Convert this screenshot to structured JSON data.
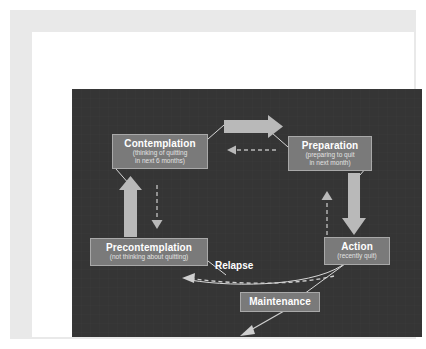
{
  "figure": {
    "panel_background": "#353535",
    "box_fill": "#7a7a7a",
    "box_border": "#a9a9a9",
    "arrow_fill": "#b9b9b9",
    "line_color": "#d8d8d8",
    "mat_color": "#e9e9e9",
    "page_color": "#ffffff"
  },
  "diagram": {
    "type": "cycle",
    "stages": [
      {
        "id": "precontemplation",
        "title": "Precontemplation",
        "subtitle_line1": "(not thinking about quitting)",
        "subtitle_line2": ""
      },
      {
        "id": "contemplation",
        "title": "Contemplation",
        "subtitle_line1": "(thinking of quitting",
        "subtitle_line2": "in next 6 months)"
      },
      {
        "id": "preparation",
        "title": "Preparation",
        "subtitle_line1": "(preparing to quit",
        "subtitle_line2": "in next month)"
      },
      {
        "id": "action",
        "title": "Action",
        "subtitle_line1": "(recently quit)",
        "subtitle_line2": ""
      },
      {
        "id": "maintenance",
        "title": "Maintenance",
        "subtitle_line1": "",
        "subtitle_line2": ""
      }
    ],
    "relapse_label": "Relapse",
    "connectors": [
      {
        "from": "contemplation",
        "to": "preparation",
        "style": "solid-thick",
        "direction": "right"
      },
      {
        "from": "preparation",
        "to": "contemplation",
        "style": "dashed-thin",
        "direction": "left"
      },
      {
        "from": "precontemplation",
        "to": "contemplation",
        "style": "solid-thick",
        "direction": "up"
      },
      {
        "from": "contemplation",
        "to": "precontemplation",
        "style": "dashed-thin",
        "direction": "down"
      },
      {
        "from": "preparation",
        "to": "action",
        "style": "solid-thick",
        "direction": "down"
      },
      {
        "from": "action",
        "to": "preparation",
        "style": "dashed-thin",
        "direction": "up"
      },
      {
        "from": "action",
        "to": "precontemplation",
        "style": "dashed-curve",
        "direction": "left",
        "label": "Relapse"
      },
      {
        "from": "action",
        "to": "maintenance",
        "style": "solid-thin",
        "direction": "down-left"
      },
      {
        "from": "maintenance",
        "to": "relapse-exit",
        "style": "solid-thin-arrow",
        "direction": "down-left"
      }
    ]
  }
}
